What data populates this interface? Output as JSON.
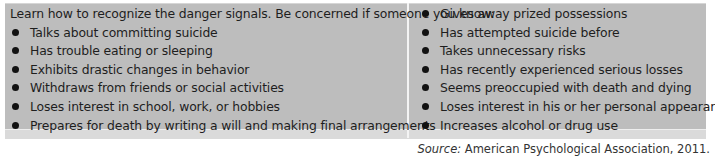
{
  "intro": "Learn how to recognize the danger signals. Be concerned if someone you know:",
  "left_items": [
    "Talks about committing suicide",
    "Has trouble eating or sleeping",
    "Exhibits drastic changes in behavior",
    "Withdraws from friends or social activities",
    "Loses interest in school, work, or hobbies",
    "Prepares for death by writing a will and making final arrangements"
  ],
  "right_items": [
    "Gives away prized possessions",
    "Has attempted suicide before",
    "Takes unnecessary risks",
    "Has recently experienced serious losses",
    "Seems preoccupied with death and dying",
    "Loses interest in his or her personal appearance",
    "Increases alcohol or drug use"
  ],
  "source": {
    "label": "Source:",
    "text": " American Psychological Association, 2011."
  },
  "colors": {
    "box_background": "#bdbdbd",
    "band_background": "#dadada",
    "divider": "#f4f4f4",
    "text": "#1e1e1e"
  }
}
